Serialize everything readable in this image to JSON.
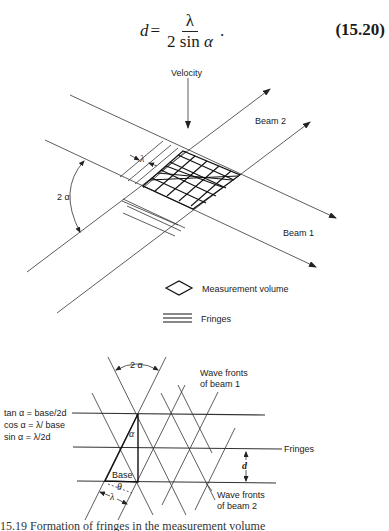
{
  "equation": {
    "lhs": "d",
    "equals": "=",
    "numerator": "λ",
    "denominator_prefix": "2 sin ",
    "denominator_var": "α",
    "trailing": ".",
    "number": "(15.20)"
  },
  "top_diagram": {
    "velocity_label": "Velocity",
    "beam2_label": "Beam 2",
    "beam1_label": "Beam 1",
    "angle_label": "2 α",
    "spacing_label": "λ",
    "legend": [
      {
        "icon": "diamond-icon",
        "label": "Measurement volume"
      },
      {
        "icon": "fringes-icon",
        "label": "Fringes"
      }
    ]
  },
  "bottom_diagram": {
    "angle_top_label": "2 α",
    "wavefronts_beam1_label_line1": "Wave fronts",
    "wavefronts_beam1_label_line2": "of beam 1",
    "wavefronts_beam2_label_line1": "Wave fronts",
    "wavefronts_beam2_label_line2": "of beam 2",
    "fringes_label": "Fringes",
    "d_label": "d",
    "alpha_label": "α",
    "base_label": "Base",
    "theta_label": "θ",
    "lambda_label": "λ",
    "formulas": [
      "tan α = base/2d",
      "cos α = λ/ base",
      "sin α = λ/2d"
    ]
  },
  "caption_partial": "15.19   Formation of fringes in the measurement volume"
}
